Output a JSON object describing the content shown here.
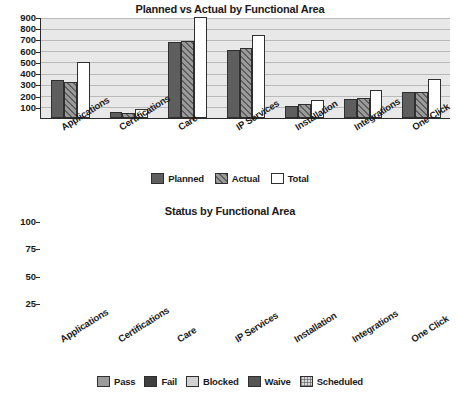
{
  "chart_data": [
    {
      "type": "bar",
      "title": "Planned vs Actual by Functional Area",
      "xlabel": "",
      "ylabel": "",
      "ylim": [
        0,
        900
      ],
      "yticks": [
        100,
        200,
        300,
        400,
        500,
        600,
        700,
        800,
        900
      ],
      "grid": true,
      "legend_position": "bottom",
      "categories": [
        "Applications",
        "Certifications",
        "Care",
        "IP Services",
        "Installation",
        "Integrations",
        "One Click"
      ],
      "series": [
        {
          "name": "Planned",
          "values": [
            335,
            55,
            675,
            610,
            110,
            170,
            235
          ],
          "color": "#5e5e5e",
          "fill": "solid"
        },
        {
          "name": "Actual",
          "values": [
            320,
            45,
            690,
            620,
            125,
            175,
            235
          ],
          "color": "#9a9a9a",
          "fill": "hatched"
        },
        {
          "name": "Total",
          "values": [
            495,
            80,
            900,
            740,
            160,
            250,
            350
          ],
          "color": "#ffffff",
          "fill": "open"
        }
      ]
    },
    {
      "type": "bar",
      "subtype": "stacked-100",
      "title": "Status by Functional Area",
      "xlabel": "",
      "ylabel": "",
      "ylim": [
        0,
        100
      ],
      "yticks": [
        25,
        50,
        75,
        100
      ],
      "grid": true,
      "legend_position": "bottom",
      "categories": [
        "Applications",
        "Certifications",
        "Care",
        "IP Services",
        "Installation",
        "Integrations",
        "One Click"
      ],
      "series": [
        {
          "name": "Pass",
          "values": [
            57,
            43,
            64,
            69,
            67,
            60,
            52
          ],
          "color": "#9b9b9b"
        },
        {
          "name": "Fail",
          "values": [
            1,
            2,
            1,
            0,
            0,
            1,
            2
          ],
          "color": "#3f3f3f"
        },
        {
          "name": "Blocked",
          "values": [
            1,
            5,
            1,
            5,
            0,
            2,
            4
          ],
          "color": "#d2d2d2"
        },
        {
          "name": "Waive",
          "values": [
            8,
            10,
            8,
            12,
            3,
            8,
            9
          ],
          "color": "#555555"
        },
        {
          "name": "Scheduled",
          "values": [
            33,
            40,
            26,
            14,
            30,
            29,
            33
          ],
          "color": "#d8d8d8"
        }
      ]
    }
  ],
  "top_chart": {
    "title": "Planned vs Actual by Functional Area",
    "yticks": [
      "900",
      "800",
      "700",
      "600",
      "500",
      "400",
      "300",
      "200",
      "100"
    ],
    "categories": [
      "Applications",
      "Certifications",
      "Care",
      "IP Services",
      "Installation",
      "Integrations",
      "One Click"
    ],
    "legend": [
      {
        "label": "Planned",
        "swatch": "planned"
      },
      {
        "label": "Actual",
        "swatch": "actual"
      },
      {
        "label": "Total",
        "swatch": "total"
      }
    ]
  },
  "bottom_chart": {
    "title": "Status by Functional Area",
    "yticks": [
      "100",
      "75",
      "50",
      "25"
    ],
    "categories": [
      "Applications",
      "Certifications",
      "Care",
      "IP Services",
      "Installation",
      "Integrations",
      "One Click"
    ],
    "legend": [
      {
        "label": "Pass",
        "swatch": "pass"
      },
      {
        "label": "Fail",
        "swatch": "fail"
      },
      {
        "label": "Blocked",
        "swatch": "blocked"
      },
      {
        "label": "Waive",
        "swatch": "waive"
      },
      {
        "label": "Scheduled",
        "swatch": "scheduled"
      }
    ]
  }
}
